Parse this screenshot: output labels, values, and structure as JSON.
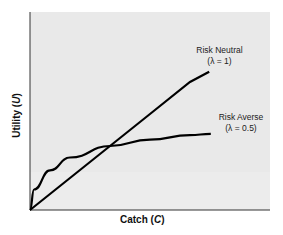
{
  "chart_data": {
    "type": "line",
    "title": "",
    "xlabel": "Catch (C)",
    "ylabel": "Utility (U)",
    "xlabel_parts": {
      "text": "Catch (",
      "var": "C",
      "close": ")"
    },
    "ylabel_parts": {
      "text": "Utility (",
      "var": "U",
      "close": ")"
    },
    "x_ticks": [],
    "y_ticks": [],
    "grid": false,
    "legend": "none (direct annotations)",
    "xlim": [
      0,
      2.26
    ],
    "ylim": [
      0,
      2.5
    ],
    "series": [
      {
        "name": "Risk Neutral",
        "parameter": "λ = 1",
        "x": [
          0,
          0.5,
          1.0,
          1.5,
          2.0,
          2.24
        ],
        "y": [
          0,
          0.5,
          1.0,
          1.5,
          2.0,
          2.16
        ]
      },
      {
        "name": "Risk Averse",
        "parameter": "λ = 0.5",
        "x": [
          0,
          0.05,
          0.25,
          0.5,
          1.0,
          1.5,
          2.0,
          2.26
        ],
        "y": [
          0,
          0.32,
          0.62,
          0.82,
          1.0,
          1.1,
          1.17,
          1.19
        ]
      }
    ],
    "annotations": [
      {
        "text": "Risk Neutral",
        "sub": "(λ = 1)"
      },
      {
        "text": "Risk Averse",
        "sub": "(λ = 0.5)"
      }
    ]
  },
  "labels": {
    "y_axis": "Utility (U)",
    "x_axis": "Catch (C)",
    "neutral_name": "Risk Neutral",
    "neutral_param": "(λ = 1)",
    "averse_name": "Risk Averse",
    "averse_param": "(λ = 0.5)"
  },
  "colors": {
    "plot_background": "#e9e9e9",
    "curve": "#000000",
    "axis": "#333333",
    "text": "#222222"
  }
}
